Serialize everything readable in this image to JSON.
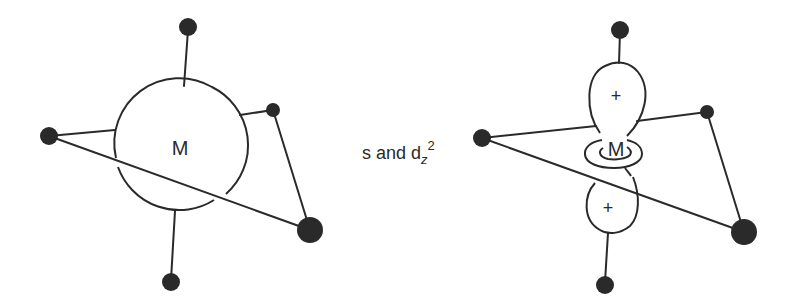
{
  "figure": {
    "left_panel": {
      "metal_label": "M",
      "description": "metal center with spherical s orbital and five ligands"
    },
    "caption": {
      "prefix": "s and d",
      "subscript": "z",
      "superscript": "2"
    },
    "right_panel": {
      "metal_label": "M",
      "upper_lobe_sign": "+",
      "lower_lobe_sign": "+",
      "description": "metal center with dz2 orbital (two lobes and torus) and five ligands"
    }
  },
  "colors": {
    "line": "#2a2a2a",
    "background": "#ffffff"
  }
}
